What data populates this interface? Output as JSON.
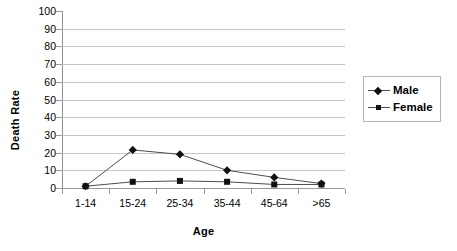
{
  "chart_data": {
    "type": "line",
    "title": "",
    "xlabel": "Age",
    "ylabel": "Death Rate",
    "categories": [
      "1-14",
      "15-24",
      "25-34",
      "35-44",
      "45-64",
      ">65"
    ],
    "series": [
      {
        "name": "Male",
        "marker": "diamond",
        "values": [
          1,
          21.5,
          19,
          10,
          6,
          2.5
        ]
      },
      {
        "name": "Female",
        "marker": "square",
        "values": [
          1,
          3.5,
          4,
          3.5,
          2,
          2
        ]
      }
    ],
    "ylim": [
      0,
      100
    ],
    "y_ticks": [
      0,
      10,
      20,
      30,
      40,
      50,
      60,
      70,
      80,
      90,
      100
    ],
    "y_tick_labels": [
      "0",
      "10",
      "20",
      "30",
      "40",
      "50",
      "60",
      "70",
      "80",
      "90",
      "100"
    ],
    "grid": true,
    "gridlines_at": [
      0,
      10,
      20,
      30,
      40,
      50,
      60,
      70,
      80,
      90
    ],
    "legend_position": "right",
    "colors": {
      "line": "#4d4d4d",
      "marker": "#111111",
      "gridline": "#c4c4c4",
      "axis": "#8f8f8f",
      "background": "#ffffff",
      "text": "#000000"
    }
  },
  "legend": {
    "items": [
      {
        "label": "Male",
        "marker": "diamond"
      },
      {
        "label": "Female",
        "marker": "square"
      }
    ]
  }
}
